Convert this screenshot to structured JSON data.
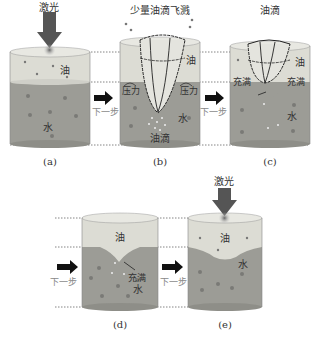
{
  "colors": {
    "oil": "#dfe0d8",
    "oil_top": "#e8e8e2",
    "water": "#9c9c96",
    "water_dark": "#8a8a84",
    "dot": "#7a7a76",
    "arrow": "#555555",
    "laser_burst": "#888888",
    "guide_line": "#777777"
  },
  "panels": [
    {
      "id": "a",
      "caption": "(a)",
      "laser_label": "激光",
      "oil_label": "油",
      "water_label": "水"
    },
    {
      "id": "b",
      "caption": "(b)",
      "top_label": "少量油滴飞溅",
      "oil_label": "油",
      "water_label": "水",
      "pressure_left": "压力",
      "pressure_right": "压力",
      "droplet_label": "油滴"
    },
    {
      "id": "c",
      "caption": "(c)",
      "top_label": "油滴",
      "oil_label": "油",
      "water_label": "水",
      "fill_left": "充满",
      "fill_right": "充满"
    },
    {
      "id": "d",
      "caption": "(d)",
      "oil_label": "油",
      "water_label": "水",
      "fill_label": "充满"
    },
    {
      "id": "e",
      "caption": "(e)",
      "laser_label": "激光",
      "oil_label": "油",
      "water_label": "水"
    }
  ],
  "steps": {
    "next_step": "下一步"
  }
}
